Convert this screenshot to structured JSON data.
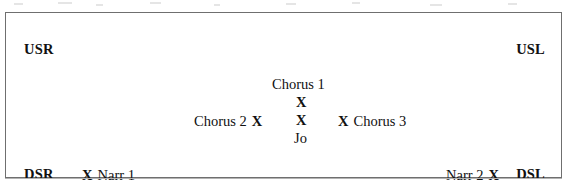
{
  "figure": {
    "type": "stage-blocking-diagram",
    "shape": "rectangle",
    "background_color": "#ffffff",
    "border_color": "#6f6f6f",
    "text_color": "#111111",
    "mark_glyph": "X"
  },
  "corners": {
    "upstage_right": "USR",
    "upstage_left": "USL",
    "downstage_right": "DSR",
    "downstage_left": "DSL"
  },
  "blocking": {
    "chorus_1": {
      "label": "Chorus 1",
      "mark": "X",
      "label_position": "above"
    },
    "chorus_2": {
      "label": "Chorus 2",
      "mark": "X",
      "label_position": "left"
    },
    "chorus_3": {
      "label": "Chorus 3",
      "mark": "X",
      "label_position": "right"
    },
    "jo": {
      "label": "Jo",
      "mark": "X",
      "label_position": "below"
    },
    "narrator_1": {
      "label": "Narr 1",
      "mark": "X",
      "label_position": "right"
    },
    "narrator_2": {
      "label": "Narr 2",
      "mark": "X",
      "label_position": "left"
    }
  }
}
